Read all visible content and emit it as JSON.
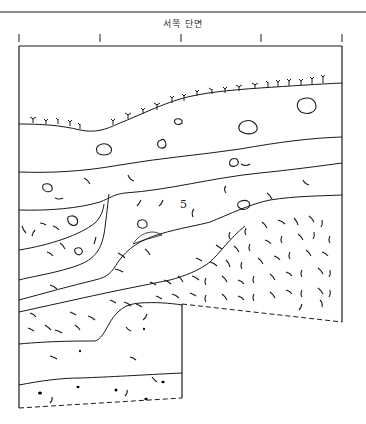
{
  "figure": {
    "title": "서쪽 단면",
    "caption": "",
    "layer_labels": [
      {
        "id": "layer-5",
        "text": "5",
        "x": 180,
        "y": 208
      }
    ],
    "colors": {
      "ink": "#1a1a1a",
      "background": "#ffffff",
      "stone_hatch": "#1a1a1a"
    },
    "scale_ticks": [
      19,
      100,
      181,
      261,
      342
    ],
    "legend": {
      "grass": "surface-vegetation",
      "hatched_blob": "stone",
      "arc": "soil-inclusion",
      "dot": "pebble",
      "dashed_line": "excavation-bottom"
    }
  }
}
